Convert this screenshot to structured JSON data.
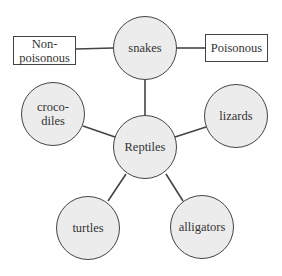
{
  "diagram": {
    "type": "concept-map",
    "center": {
      "id": "reptiles",
      "label": "Reptiles"
    },
    "nodes": [
      {
        "id": "snakes",
        "label": "snakes",
        "cx": 145,
        "cy": 48,
        "r": 32
      },
      {
        "id": "crocodiles",
        "label": "croco-\ndiles",
        "cx": 53,
        "cy": 114,
        "r": 32
      },
      {
        "id": "lizards",
        "label": "lizards",
        "cx": 236,
        "cy": 116,
        "r": 32
      },
      {
        "id": "reptiles",
        "label": "Reptiles",
        "cx": 145,
        "cy": 147,
        "r": 32
      },
      {
        "id": "turtles",
        "label": "turtles",
        "cx": 88,
        "cy": 228,
        "r": 32
      },
      {
        "id": "alligators",
        "label": "alligators",
        "cx": 202,
        "cy": 227,
        "r": 32
      }
    ],
    "boxes": [
      {
        "id": "non-poisonous",
        "label": "Non-\npoisonous",
        "x": 13,
        "y": 36,
        "w": 63,
        "h": 29
      },
      {
        "id": "poisonous",
        "label": "Poisonous",
        "x": 205,
        "y": 34,
        "w": 63,
        "h": 28
      }
    ],
    "edges": [
      {
        "from": "reptiles",
        "to": "snakes"
      },
      {
        "from": "reptiles",
        "to": "crocodiles"
      },
      {
        "from": "reptiles",
        "to": "lizards"
      },
      {
        "from": "reptiles",
        "to": "turtles"
      },
      {
        "from": "reptiles",
        "to": "alligators"
      },
      {
        "from": "snakes",
        "to": "non-poisonous"
      },
      {
        "from": "snakes",
        "to": "poisonous"
      }
    ],
    "colors": {
      "stroke": "#444444",
      "circle_fill": "#ececec",
      "box_fill": "#ffffff",
      "text": "#333333"
    }
  }
}
